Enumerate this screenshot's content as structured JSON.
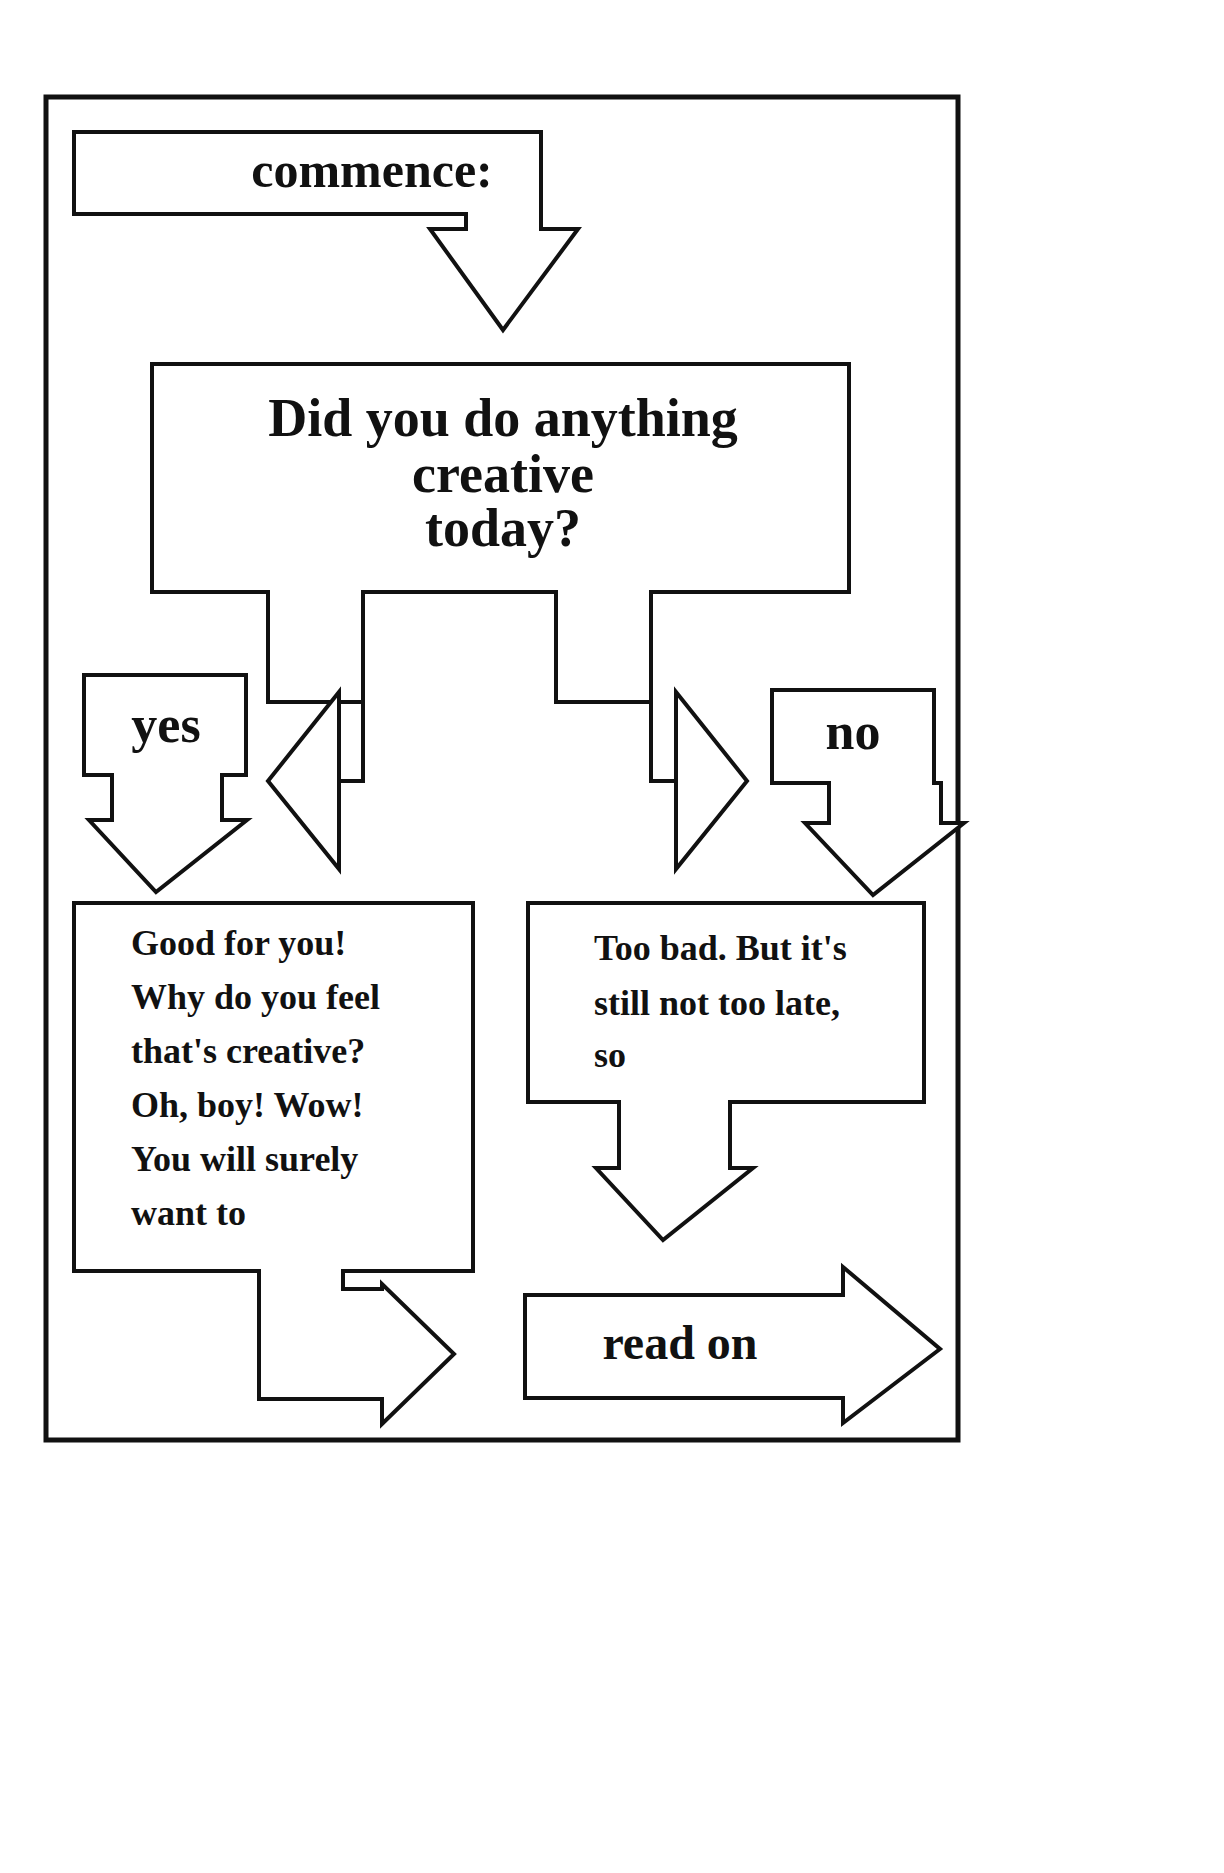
{
  "page": {
    "background_color": "#ffffff",
    "ink_color": "#111111"
  },
  "flowchart": {
    "border": {
      "name": "outer-frame"
    },
    "nodes": {
      "start": {
        "id": "commence",
        "label": "commence:",
        "shape": "box-with-down-arrow"
      },
      "question": {
        "id": "question",
        "label_lines": [
          "Did you do anything",
          "creative",
          "today?"
        ],
        "shape": "box"
      },
      "branch_yes": {
        "id": "yes",
        "label": "yes",
        "shape": "box-with-down-arrow"
      },
      "branch_no": {
        "id": "no",
        "label": "no",
        "shape": "box-with-down-arrow"
      },
      "result_yes": {
        "id": "good-for-you",
        "label_lines": [
          "Good for you!",
          "Why do you feel",
          "that's creative?",
          "Oh, boy! Wow!",
          "You will surely",
          "want to"
        ],
        "shape": "box-with-right-arrow"
      },
      "result_no": {
        "id": "too-bad",
        "label_lines": [
          "Too bad. But it's",
          "still not too late,",
          "so"
        ],
        "shape": "box-with-down-arrow"
      },
      "end": {
        "id": "read-on",
        "label": "read on",
        "shape": "right-arrow"
      }
    },
    "edges": [
      {
        "from": "commence",
        "to": "question",
        "direction": "down",
        "label": ""
      },
      {
        "from": "question",
        "to": "yes",
        "direction": "left",
        "label": ""
      },
      {
        "from": "question",
        "to": "no",
        "direction": "right",
        "label": ""
      },
      {
        "from": "yes",
        "to": "good-for-you",
        "direction": "down",
        "label": ""
      },
      {
        "from": "no",
        "to": "too-bad",
        "direction": "down",
        "label": ""
      },
      {
        "from": "good-for-you",
        "to": "read-on",
        "direction": "right",
        "label": ""
      },
      {
        "from": "too-bad",
        "to": "read-on",
        "direction": "down",
        "label": ""
      }
    ]
  }
}
